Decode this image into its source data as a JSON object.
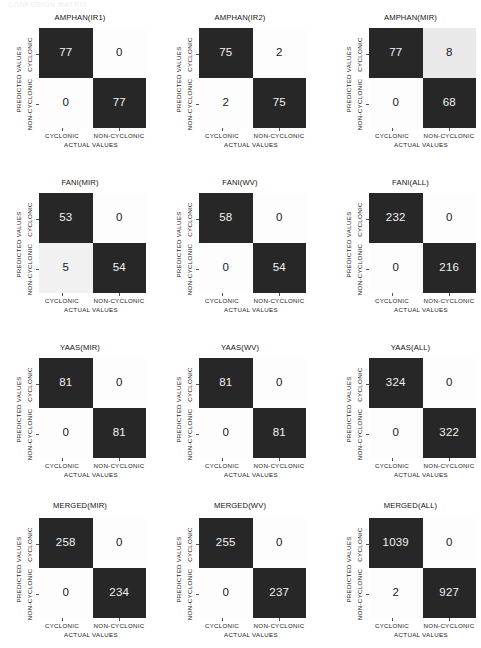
{
  "figure": {
    "scan_artifact_text": "CONFUSION MATRIX",
    "axis_labels": {
      "y_outer": "PREDICTED VALUES",
      "x_outer": "ACTUAL VALUES",
      "y_ticks": [
        "CYCLONIC",
        "NON-CYCLONIC"
      ],
      "x_ticks": [
        "CYCLONIC",
        "NON-CYCLONIC"
      ]
    },
    "colors": {
      "cell_dark": "#272727",
      "cell_light": "#fdfdfd",
      "cell_gray": "#e9e9e9",
      "text_dark": "#1a1a1a",
      "text_light": "#f2f2f2",
      "background": "#ffffff"
    }
  },
  "chart_data": {
    "type": "heatmap",
    "subtype": "confusion-matrix-grid",
    "grid": {
      "rows": 4,
      "cols": 3
    },
    "xlabel": "ACTUAL VALUES",
    "ylabel": "PREDICTED VALUES",
    "categories": [
      "CYCLONIC",
      "NON-CYCLONIC"
    ],
    "colormap": "grayscale (dark = high count, light = low count)",
    "panels": [
      {
        "title": "AMPHAN(IR1)",
        "matrix": [
          [
            77,
            0
          ],
          [
            0,
            77
          ]
        ],
        "cells": [
          {
            "value": "77",
            "shade": "dark"
          },
          {
            "value": "0",
            "shade": "light"
          },
          {
            "value": "0",
            "shade": "light"
          },
          {
            "value": "77",
            "shade": "dark"
          }
        ]
      },
      {
        "title": "AMPHAN(IR2)",
        "matrix": [
          [
            75,
            2
          ],
          [
            2,
            75
          ]
        ],
        "cells": [
          {
            "value": "75",
            "shade": "dark"
          },
          {
            "value": "2",
            "shade": "light"
          },
          {
            "value": "2",
            "shade": "light"
          },
          {
            "value": "75",
            "shade": "dark"
          }
        ]
      },
      {
        "title": "AMPHAN(MIR)",
        "matrix": [
          [
            77,
            8
          ],
          [
            0,
            68
          ]
        ],
        "cells": [
          {
            "value": "77",
            "shade": "dark"
          },
          {
            "value": "8",
            "shade": "gray"
          },
          {
            "value": "0",
            "shade": "light"
          },
          {
            "value": "68",
            "shade": "dark"
          }
        ]
      },
      {
        "title": "FANI(MIR)",
        "matrix": [
          [
            53,
            0
          ],
          [
            5,
            54
          ]
        ],
        "cells": [
          {
            "value": "53",
            "shade": "dark"
          },
          {
            "value": "0",
            "shade": "light"
          },
          {
            "value": "5",
            "shade": "gray2"
          },
          {
            "value": "54",
            "shade": "dark"
          }
        ]
      },
      {
        "title": "FANI(WV)",
        "matrix": [
          [
            58,
            0
          ],
          [
            0,
            54
          ]
        ],
        "cells": [
          {
            "value": "58",
            "shade": "dark"
          },
          {
            "value": "0",
            "shade": "light"
          },
          {
            "value": "0",
            "shade": "light"
          },
          {
            "value": "54",
            "shade": "dark"
          }
        ]
      },
      {
        "title": "FANI(ALL)",
        "matrix": [
          [
            232,
            0
          ],
          [
            0,
            216
          ]
        ],
        "cells": [
          {
            "value": "232",
            "shade": "dark"
          },
          {
            "value": "0",
            "shade": "light"
          },
          {
            "value": "0",
            "shade": "light"
          },
          {
            "value": "216",
            "shade": "dark"
          }
        ]
      },
      {
        "title": "YAAS(MIR)",
        "matrix": [
          [
            81,
            0
          ],
          [
            0,
            81
          ]
        ],
        "cells": [
          {
            "value": "81",
            "shade": "dark"
          },
          {
            "value": "0",
            "shade": "light"
          },
          {
            "value": "0",
            "shade": "light"
          },
          {
            "value": "81",
            "shade": "dark"
          }
        ]
      },
      {
        "title": "YAAS(WV)",
        "matrix": [
          [
            81,
            0
          ],
          [
            0,
            81
          ]
        ],
        "cells": [
          {
            "value": "81",
            "shade": "dark"
          },
          {
            "value": "0",
            "shade": "light"
          },
          {
            "value": "0",
            "shade": "light"
          },
          {
            "value": "81",
            "shade": "dark"
          }
        ]
      },
      {
        "title": "YAAS(ALL)",
        "matrix": [
          [
            324,
            0
          ],
          [
            0,
            322
          ]
        ],
        "cells": [
          {
            "value": "324",
            "shade": "dark"
          },
          {
            "value": "0",
            "shade": "light"
          },
          {
            "value": "0",
            "shade": "light"
          },
          {
            "value": "322",
            "shade": "dark"
          }
        ]
      },
      {
        "title": "MERGED(MIR)",
        "matrix": [
          [
            258,
            0
          ],
          [
            0,
            234
          ]
        ],
        "cells": [
          {
            "value": "258",
            "shade": "dark"
          },
          {
            "value": "0",
            "shade": "light"
          },
          {
            "value": "0",
            "shade": "light"
          },
          {
            "value": "234",
            "shade": "dark"
          }
        ]
      },
      {
        "title": "MERGED(WV)",
        "matrix": [
          [
            255,
            0
          ],
          [
            0,
            237
          ]
        ],
        "cells": [
          {
            "value": "255",
            "shade": "dark"
          },
          {
            "value": "0",
            "shade": "light"
          },
          {
            "value": "0",
            "shade": "light"
          },
          {
            "value": "237",
            "shade": "dark"
          }
        ]
      },
      {
        "title": "MERGED(ALL)",
        "matrix": [
          [
            1039,
            0
          ],
          [
            2,
            927
          ]
        ],
        "cells": [
          {
            "value": "1039",
            "shade": "dark"
          },
          {
            "value": "0",
            "shade": "light"
          },
          {
            "value": "2",
            "shade": "light"
          },
          {
            "value": "927",
            "shade": "dark"
          }
        ]
      }
    ]
  }
}
